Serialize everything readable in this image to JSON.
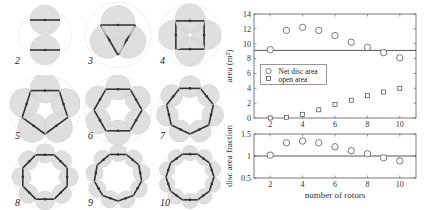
{
  "diagrams": {
    "labels": [
      "2",
      "3",
      "4",
      "5",
      "6",
      "7",
      "8",
      "9",
      "10"
    ],
    "rotor_fill": "#d9d9d9",
    "bar_color": "#333333"
  },
  "chart_data": [
    {
      "type": "scatter",
      "title": "",
      "xlabel": "",
      "ylabel": "area (m²)",
      "x": [
        2,
        3,
        4,
        5,
        6,
        7,
        8,
        9,
        10
      ],
      "xticks": [
        2,
        4,
        6,
        8,
        10
      ],
      "yticks": [
        0,
        2,
        4,
        6,
        8,
        10,
        12,
        14
      ],
      "xlim": [
        1,
        11
      ],
      "ylim": [
        0,
        14
      ],
      "grid": false,
      "reference_line": 9.1,
      "legend_position": "center-left",
      "series": [
        {
          "name": "Net disc area",
          "marker": "circle",
          "values": [
            9.2,
            11.8,
            12.2,
            11.8,
            11.1,
            10.2,
            9.5,
            8.8,
            8.1
          ]
        },
        {
          "name": "open area",
          "marker": "square",
          "values": [
            0.0,
            0.1,
            0.5,
            1.1,
            1.8,
            2.4,
            3.0,
            3.5,
            4.0
          ]
        }
      ]
    },
    {
      "type": "scatter",
      "title": "",
      "xlabel": "number of rotors",
      "ylabel": "disc area fraction",
      "x": [
        2,
        3,
        4,
        5,
        6,
        7,
        8,
        9,
        10
      ],
      "xticks": [
        2,
        4,
        6,
        8,
        10
      ],
      "yticks": [
        0.5,
        1,
        1.5
      ],
      "xlim": [
        1,
        11
      ],
      "ylim": [
        0.5,
        1.5
      ],
      "grid": false,
      "reference_line": 1.0,
      "series": [
        {
          "name": "disc area fraction",
          "marker": "circle",
          "values": [
            1.02,
            1.3,
            1.34,
            1.3,
            1.21,
            1.12,
            1.05,
            0.96,
            0.89
          ]
        }
      ]
    }
  ],
  "legend": {
    "items": [
      "Net disc area",
      "open area"
    ]
  },
  "axes_text": {
    "top_ylabel": "area (m²)",
    "bottom_ylabel": "disc area fraction",
    "bottom_xlabel": "number of rotors"
  }
}
